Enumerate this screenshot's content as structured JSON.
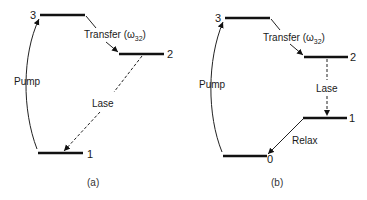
{
  "figure": {
    "panels": [
      {
        "caption": "(a)",
        "levels": [
          {
            "label": "3"
          },
          {
            "label": "2"
          },
          {
            "label": "1"
          }
        ],
        "transitions": {
          "pump": "Pump",
          "transfer": "Transfer (ω",
          "transfer_sub": "32",
          "transfer_close": ")",
          "lase": "Lase"
        }
      },
      {
        "caption": "(b)",
        "levels": [
          {
            "label": "3"
          },
          {
            "label": "2"
          },
          {
            "label": "1"
          },
          {
            "label": "0"
          }
        ],
        "transitions": {
          "pump": "Pump",
          "transfer": "Transfer (ω",
          "transfer_sub": "32",
          "transfer_close": ")",
          "lase": "Lase",
          "relax": "Relax"
        }
      }
    ]
  }
}
